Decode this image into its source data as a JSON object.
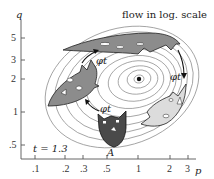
{
  "figure": {
    "title": "flow in log. scale",
    "time_label": "t = 1.3",
    "point_label": "A",
    "flow_labels": [
      "φt",
      "φt",
      "φt"
    ],
    "colors": {
      "contour": "#8a8a8a",
      "dark_mask": "#4a4a4a",
      "mid_mask": "#8c8c8c",
      "light_mask": "#dcdcdc",
      "axis": "#555555",
      "arrow": "#111111"
    }
  },
  "axes": {
    "x_label": "p",
    "y_label": "q",
    "x_ticks": [
      ".1",
      ".2",
      ".3",
      ".5",
      "1",
      "2",
      "3"
    ],
    "y_ticks": [
      "5",
      "3",
      "2",
      "1",
      ".5"
    ],
    "scale": "log"
  }
}
